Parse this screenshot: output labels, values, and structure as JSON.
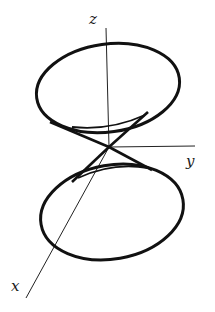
{
  "diagram": {
    "type": "double-cone-3d",
    "axes": {
      "x": {
        "label": "x"
      },
      "y": {
        "label": "y"
      },
      "z": {
        "label": "z"
      }
    },
    "colors": {
      "stroke": "#111111",
      "background": "#ffffff"
    }
  }
}
